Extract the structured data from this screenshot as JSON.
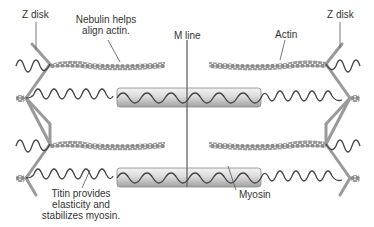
{
  "labels": {
    "z_disk_left": "Z disk",
    "z_disk_right": "Z disk",
    "nebulin_line1": "Nebulin helps",
    "nebulin_line2": "align actin.",
    "m_line": "M line",
    "actin": "Actin",
    "titin_line1": "Titin provides",
    "titin_line2": "elasticity and",
    "titin_line3": "stabilizes myosin.",
    "myosin": "Myosin"
  },
  "colors": {
    "background": "#ffffff",
    "z_disk": "#9a9a9a",
    "actin_bead": "#8c8c8c",
    "titin": "#4a4a4a",
    "myosin_light": "#f0f0f0",
    "myosin_dark": "#a8a8a8",
    "m_line": "#666666",
    "leader_line": "#555555",
    "text": "#333333"
  },
  "structure": {
    "actin_rows_y": [
      64,
      144
    ],
    "myosin_rows_y": [
      98,
      178
    ],
    "z_disk_left_x": 50,
    "z_disk_right_x": 326,
    "m_line_x": 187
  }
}
